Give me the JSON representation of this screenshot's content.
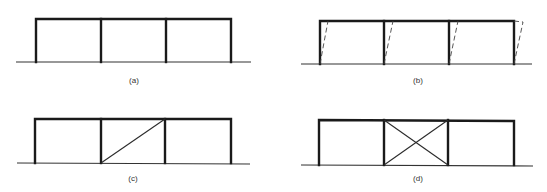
{
  "figure": {
    "colors": {
      "frame": "#1a1a1a",
      "ground": "#333333",
      "brace": "#2a2a2a",
      "deformed": "#444444",
      "label": "#333333"
    },
    "panels": [
      {
        "id": "a",
        "label": "(a)",
        "caption": "three-bay frame",
        "bracing": "none",
        "deformed_shape": false
      },
      {
        "id": "b",
        "label": "(b)",
        "caption": "three-bay frame with sway (dashed deformed columns)",
        "bracing": "none",
        "deformed_shape": true
      },
      {
        "id": "c",
        "label": "(c)",
        "caption": "three-bay frame with single diagonal brace in middle bay",
        "bracing": "single-diagonal",
        "braced_bay": 2
      },
      {
        "id": "d",
        "label": "(d)",
        "caption": "three-bay frame with X-bracing in middle bay",
        "bracing": "x-brace",
        "braced_bay": 2
      }
    ]
  }
}
